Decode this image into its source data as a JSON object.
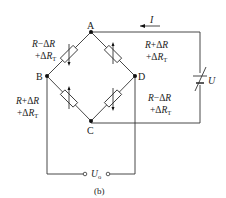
{
  "figure": {
    "caption": "(b)"
  },
  "nodes": {
    "A": "A",
    "B": "B",
    "C": "C",
    "D": "D"
  },
  "resistors": [
    {
      "arm": "A-B",
      "line1": "R−ΔR",
      "line2": "+ΔR",
      "sub": "T"
    },
    {
      "arm": "A-D",
      "line1": "R+ΔR",
      "line2": "+ΔR",
      "sub": "T"
    },
    {
      "arm": "B-C",
      "line1": "R+ΔR",
      "line2": "+ΔR",
      "sub": "T"
    },
    {
      "arm": "D-C",
      "line1": "R−ΔR",
      "line2": "+ΔR",
      "sub": "T"
    }
  ],
  "source": {
    "voltage_label": "U",
    "current_label": "I"
  },
  "output": {
    "label": "U",
    "sub": "o"
  }
}
